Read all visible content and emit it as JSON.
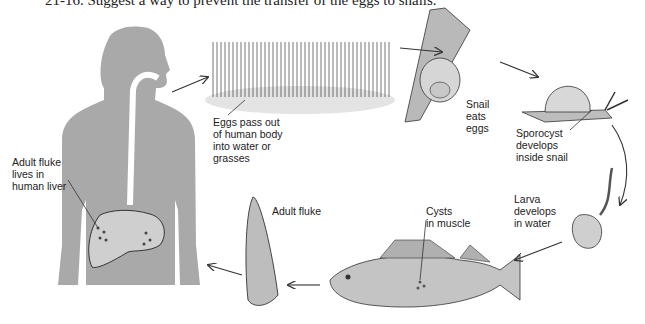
{
  "question": "21-16. Suggest a way to prevent the transfer of the eggs to snails.",
  "labels": {
    "adult_fluke_liver": [
      "Adult fluke",
      "lives in",
      "human liver"
    ],
    "eggs_pass": [
      "Eggs pass out",
      "of human body",
      "into water or",
      "grasses"
    ],
    "snail_eats": [
      "Snail",
      "eats",
      "eggs"
    ],
    "sporocyst": [
      "Sporocyst",
      "develops",
      "inside snail"
    ],
    "larva": [
      "Larva",
      "develops",
      "in water"
    ],
    "cysts": [
      "Cysts",
      "in muscle"
    ],
    "adult_fluke": [
      "Adult fluke"
    ]
  },
  "colors": {
    "body": "#a9a9a9",
    "line": "#333333",
    "background": "#ffffff"
  }
}
